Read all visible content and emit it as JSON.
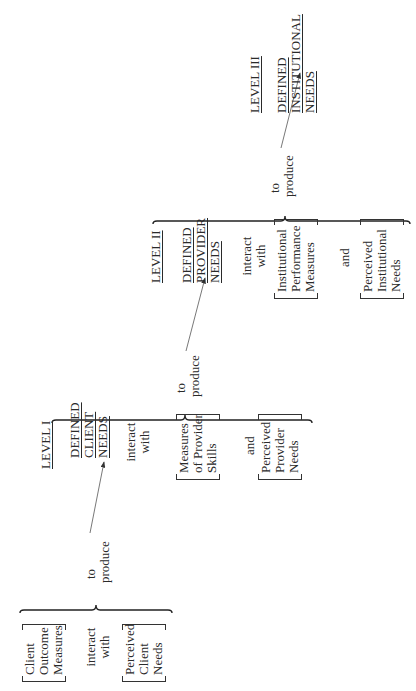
{
  "diagram": {
    "orientation": "rotated-90-ccw",
    "group0": {
      "box1": [
        "Client",
        "Outcome",
        "Measures"
      ],
      "connector": [
        "interact",
        "with"
      ],
      "box2": [
        "Perceived",
        "Client",
        "Needs"
      ],
      "produce": [
        "to",
        "produce"
      ]
    },
    "level1": {
      "title": "LEVEL I",
      "defined": [
        "DEFINED",
        "CLIENT",
        "NEEDS"
      ],
      "connector": [
        "interact",
        "with"
      ],
      "box1": [
        "Measures",
        "of Provider",
        "Skills"
      ],
      "and": "and",
      "box2": [
        "Perceived",
        "Provider",
        "Needs"
      ],
      "produce": [
        "to",
        "produce"
      ]
    },
    "level2": {
      "title": "LEVEL II",
      "defined": [
        "DEFINED",
        "PROVIDER",
        "NEEDS"
      ],
      "connector": [
        "interact",
        "with"
      ],
      "box1": [
        "Institutional",
        "Performance",
        "Measures"
      ],
      "and": "and",
      "box2": [
        "Perceived",
        "Institutional",
        "Needs"
      ],
      "produce": [
        "to",
        "produce"
      ]
    },
    "level3": {
      "title": "LEVEL III",
      "defined": [
        "DEFINED",
        "INSTITUTIONAL",
        "NEEDS"
      ]
    },
    "colors": {
      "ink": "#2a2a2a",
      "background": "#ffffff"
    }
  }
}
